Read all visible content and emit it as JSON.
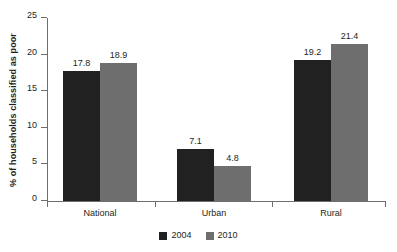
{
  "chart_data": {
    "type": "bar",
    "title": "",
    "subtitle": "",
    "xlabel": "",
    "ylabel": "% of households classified as poor",
    "ylim": [
      0,
      25
    ],
    "yticks": [
      0,
      5,
      10,
      15,
      20,
      25
    ],
    "ytick_labels": [
      "0",
      "5",
      "10",
      "15",
      "20",
      "25"
    ],
    "grid": false,
    "legend_position": "bottom-center",
    "categories": [
      "National",
      "Urban",
      "Rural"
    ],
    "series": [
      {
        "name": "2004",
        "color": "#212121",
        "values": [
          17.8,
          7.1,
          19.2
        ],
        "labels": [
          "17.8",
          "7.1",
          "19.2"
        ]
      },
      {
        "name": "2010",
        "color": "#6e6e6e",
        "values": [
          18.9,
          4.8,
          21.4
        ],
        "labels": [
          "18.9",
          "4.8",
          "21.4"
        ]
      }
    ]
  },
  "axis": {
    "line_color": "#6d6e70"
  }
}
